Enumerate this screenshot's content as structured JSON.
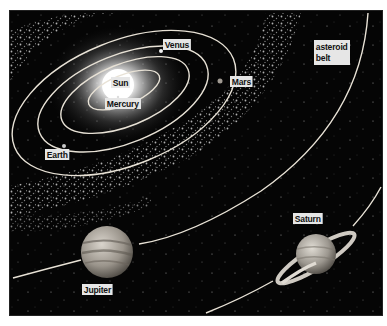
{
  "diagram": {
    "labels": {
      "sun": "Sun",
      "mercury": "Mercury",
      "venus": "Venus",
      "earth": "Earth",
      "mars": "Mars",
      "asteroid_belt": "asteroid\nbelt",
      "jupiter": "Jupiter",
      "saturn": "Saturn"
    },
    "colors": {
      "background": "#050505",
      "orbit": "#e8e2d6",
      "label_bg": "#e6e6e6",
      "label_text": "#111111",
      "sun_core": "#ffffff",
      "sun_glow": "#9a9a9a"
    }
  }
}
